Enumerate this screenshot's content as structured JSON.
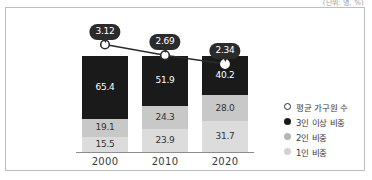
{
  "caption": {
    "unit": "(단위: 명, %)"
  },
  "chart_data": {
    "type": "bar",
    "title": "",
    "subtitle": "",
    "xlabel": "",
    "ylabel": "",
    "ylim": [
      0,
      100
    ],
    "grid": false,
    "legend_position": "right",
    "stacked": true,
    "categories": [
      "2000",
      "2010",
      "2020"
    ],
    "series": [
      {
        "name": "3인 이상 비중",
        "color": "#1a1a1a",
        "values": [
          65.4,
          51.9,
          40.2
        ]
      },
      {
        "name": "2인 비중",
        "color": "#c8c8c8",
        "values": [
          19.1,
          24.3,
          28.0
        ]
      },
      {
        "name": "1인 비중",
        "color": "#dcdcdc",
        "values": [
          15.5,
          23.9,
          31.7
        ]
      }
    ],
    "line_series": {
      "name": "평균 가구원 수",
      "values": [
        3.12,
        2.69,
        2.34
      ],
      "labels": [
        "3.12",
        "2.69",
        "2.34"
      ],
      "marker": "hollow-circle",
      "line_color": "#2b2b2b"
    }
  },
  "legend": {
    "items": [
      {
        "label": "평균 가구원 수",
        "marker": "hollow-circle-marker"
      },
      {
        "label": "3인 이상 비중",
        "marker": "black-dot-marker"
      },
      {
        "label": "2인 비중",
        "marker": "gray-dot-marker"
      },
      {
        "label": "1인 비중",
        "marker": "light-gray-dot-marker"
      }
    ]
  },
  "bars": [
    {
      "year": "2000",
      "segments": [
        {
          "key": "three",
          "value": "65.4"
        },
        {
          "key": "two",
          "value": "19.1"
        },
        {
          "key": "one",
          "value": "15.5"
        }
      ],
      "bubble": "3.12"
    },
    {
      "year": "2010",
      "segments": [
        {
          "key": "three",
          "value": "51.9"
        },
        {
          "key": "two",
          "value": "24.3"
        },
        {
          "key": "one",
          "value": "23.9"
        }
      ],
      "bubble": "2.69"
    },
    {
      "year": "2020",
      "segments": [
        {
          "key": "three",
          "value": "40.2"
        },
        {
          "key": "two",
          "value": "28.0"
        },
        {
          "key": "one",
          "value": "31.7"
        }
      ],
      "bubble": "2.34"
    }
  ]
}
